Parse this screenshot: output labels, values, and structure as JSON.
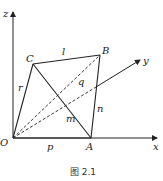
{
  "figure": {
    "caption": "图 2.1",
    "axes": {
      "x": "x",
      "y": "y",
      "z": "z"
    },
    "points": {
      "O": "O",
      "A": "A",
      "B": "B",
      "C": "C"
    },
    "edges": {
      "OA": "p",
      "AB": "n",
      "BC": "l",
      "CO": "r",
      "CA": "m",
      "OB": "q"
    },
    "colors": {
      "stroke": "#222222",
      "background": "#ffffff"
    }
  }
}
